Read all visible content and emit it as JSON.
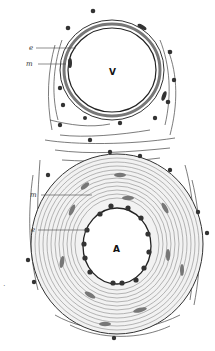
{
  "figure": {
    "vein_label": "V",
    "artery_label": "A",
    "leaders": [
      {
        "id": "vein-endothelium",
        "text": "e",
        "x": 30,
        "y": 47,
        "tx": 76,
        "ty": 47
      },
      {
        "id": "vein-media",
        "text": "m",
        "x": 30,
        "y": 63,
        "tx": 72,
        "ty": 63
      },
      {
        "id": "artery-media",
        "text": "m",
        "x": 33,
        "y": 194,
        "tx": 92,
        "ty": 194
      },
      {
        "id": "artery-endothelium",
        "text": "e",
        "x": 33,
        "y": 229,
        "tx": 92,
        "ty": 229
      }
    ],
    "stray_mark": "·",
    "colors": {
      "ink": "#222222",
      "mid": "#666666",
      "light": "#999999",
      "background": "#ffffff"
    }
  }
}
